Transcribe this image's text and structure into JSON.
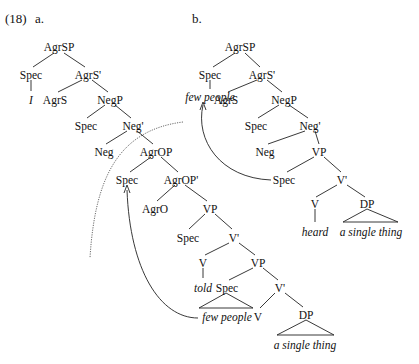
{
  "example": {
    "number": "(18)",
    "label_a": "a.",
    "label_b": "b."
  },
  "tree_a": {
    "AgrSP": "AgrSP",
    "spec1": "Spec",
    "AgrS_bar": "AgrS'",
    "I": "I",
    "AgrS": "AgrS",
    "NegP": "NegP",
    "spec2": "Spec",
    "Neg_bar": "Neg'",
    "Neg": "Neg",
    "AgrOP": "AgrOP",
    "spec3": "Spec",
    "AgrOP_bar": "AgrOP'",
    "AgrO": "AgrO",
    "VP1": "VP",
    "spec4": "Spec",
    "V_bar1": "V'",
    "V1": "V",
    "VP2": "VP",
    "told": "told",
    "spec5": "Spec",
    "V_bar2": "V'",
    "few_people": "few people",
    "V2": "V",
    "DP": "DP",
    "a_single_thing": "a single thing"
  },
  "tree_b": {
    "AgrSP": "AgrSP",
    "spec1": "Spec",
    "AgrS_bar": "AgrS'",
    "few_people": "few people",
    "AgrS": "AgrS",
    "NegP": "NegP",
    "spec2": "Spec",
    "Neg_bar": "Neg'",
    "Neg": "Neg",
    "VP": "VP",
    "spec3": "Spec",
    "V_bar": "V'",
    "V": "V",
    "DP": "DP",
    "heard": "heard",
    "a_single_thing": "a single thing"
  }
}
